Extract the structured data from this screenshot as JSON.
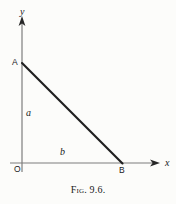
{
  "figure": {
    "caption": "Fig. 9.6.",
    "background_color": "#fcfcfa",
    "axis_color": "#777777",
    "line_color": "#1a1a1a",
    "text_color": "#1a1a1a"
  },
  "axes": {
    "y_axis": {
      "label": "y",
      "x": 22,
      "y_top": 18,
      "y_bottom": 172,
      "arrow": "up"
    },
    "x_axis": {
      "label": "x",
      "y": 163,
      "x_left": 10,
      "x_right": 158,
      "arrow": "right"
    },
    "origin_label": "O"
  },
  "triangle": {
    "vertex_A": {
      "label": "A",
      "x": 22,
      "y": 63
    },
    "vertex_B": {
      "label": "B",
      "x": 122,
      "y": 163
    },
    "vertex_O": {
      "label": "O",
      "x": 22,
      "y": 163
    },
    "side_vertical_label": "a",
    "side_horizontal_label": "b",
    "hypotenuse_stroke_width": 2.1
  }
}
